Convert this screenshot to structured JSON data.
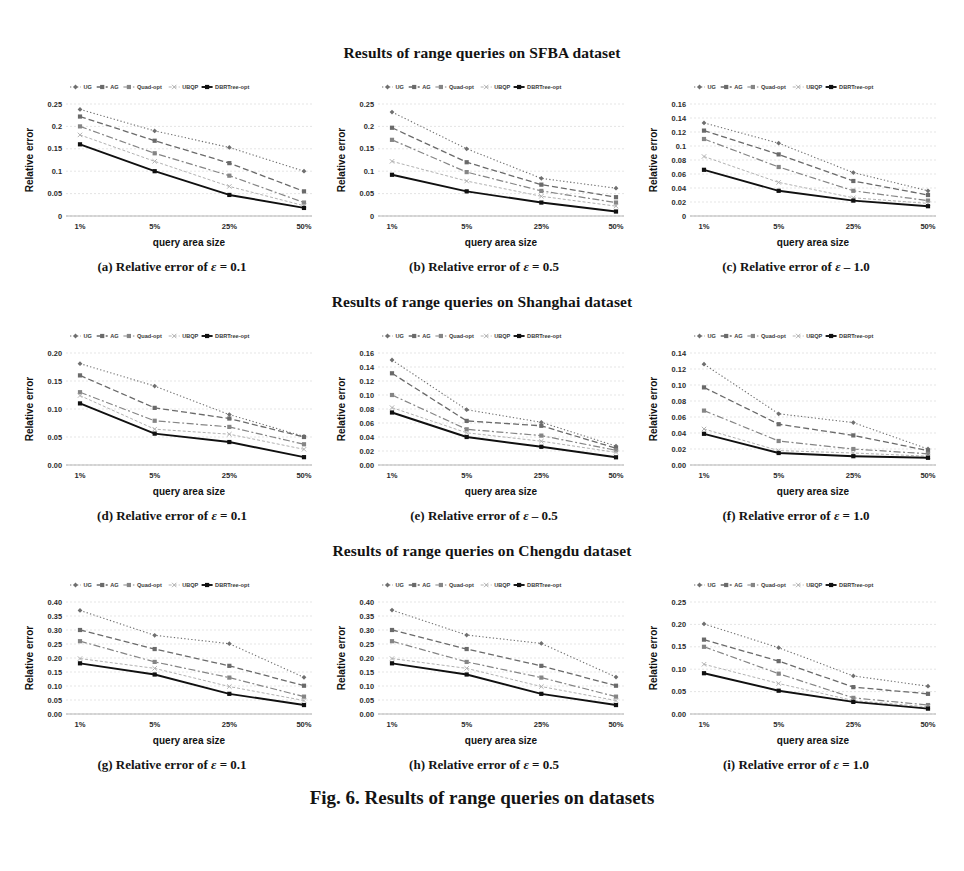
{
  "figure": {
    "caption": "Fig. 6. Results of range queries on datasets",
    "sections": [
      {
        "title": "Results of range queries on SFBA dataset"
      },
      {
        "title": "Results of range queries on Shanghai dataset"
      },
      {
        "title": "Results of range queries on Chengdu dataset"
      }
    ]
  },
  "series_names": [
    "UG",
    "AG",
    "Quad-opt",
    "UBQP",
    "DBRTree-opt"
  ],
  "series_colors": [
    "#7b7b7b",
    "#6e6e6e",
    "#8a8a8a",
    "#b0b0b0",
    "#111111"
  ],
  "axis": {
    "xlabel": "query area size",
    "ylabel": "Relative error",
    "categories": [
      "1%",
      "5%",
      "25%",
      "50%"
    ]
  },
  "chart_data": [
    {
      "id": "a",
      "type": "line",
      "title": "(a) Relative error of ε = 0.1",
      "caption_prefix": "(a) Relative error of",
      "caption_eps": "ε",
      "caption_value": "= 0.1",
      "dataset": "SFBA",
      "epsilon": 0.1,
      "xlabel": "query area size",
      "ylabel": "Relative error",
      "categories": [
        "1%",
        "5%",
        "25%",
        "50%"
      ],
      "ylim": [
        0,
        0.25
      ],
      "yticks": [
        0,
        0.05,
        0.1,
        0.15,
        0.2,
        0.25
      ],
      "ytick_labels": [
        "0",
        "0.05",
        "0.1",
        "0.15",
        "0.2",
        "0.25"
      ],
      "grid": true,
      "legend_position": "top",
      "series": [
        {
          "name": "UG",
          "values": [
            0.238,
            0.19,
            0.153,
            0.1
          ]
        },
        {
          "name": "AG",
          "values": [
            0.222,
            0.168,
            0.118,
            0.055
          ]
        },
        {
          "name": "Quad-opt",
          "values": [
            0.2,
            0.14,
            0.09,
            0.03
          ]
        },
        {
          "name": "UBQP",
          "values": [
            0.181,
            0.122,
            0.066,
            0.023
          ]
        },
        {
          "name": "DBRTree-opt",
          "values": [
            0.16,
            0.1,
            0.047,
            0.018
          ]
        }
      ]
    },
    {
      "id": "b",
      "type": "line",
      "title": "(b) Relative error of ε = 0.5",
      "caption_prefix": "(b) Relative error of",
      "caption_eps": "ε",
      "caption_value": "= 0.5",
      "dataset": "SFBA",
      "epsilon": 0.5,
      "xlabel": "query area size",
      "ylabel": "Relative error",
      "categories": [
        "1%",
        "5%",
        "25%",
        "50%"
      ],
      "ylim": [
        0,
        0.25
      ],
      "yticks": [
        0,
        0.05,
        0.1,
        0.15,
        0.2,
        0.25
      ],
      "ytick_labels": [
        "0",
        "0.05",
        "0.1",
        "0.15",
        "0.2",
        "0.25"
      ],
      "grid": true,
      "legend_position": "top",
      "series": [
        {
          "name": "UG",
          "values": [
            0.232,
            0.15,
            0.084,
            0.062
          ]
        },
        {
          "name": "AG",
          "values": [
            0.197,
            0.12,
            0.07,
            0.042
          ]
        },
        {
          "name": "Quad-opt",
          "values": [
            0.17,
            0.098,
            0.056,
            0.03
          ]
        },
        {
          "name": "UBQP",
          "values": [
            0.122,
            0.078,
            0.044,
            0.022
          ]
        },
        {
          "name": "DBRTree-opt",
          "values": [
            0.092,
            0.055,
            0.03,
            0.01
          ]
        }
      ]
    },
    {
      "id": "c",
      "type": "line",
      "title": "(c) Relative error of ε = 1.0",
      "caption_prefix": "(c) Relative error of",
      "caption_eps": "ε",
      "caption_value": "– 1.0",
      "dataset": "SFBA",
      "epsilon": 1.0,
      "xlabel": "query area size",
      "ylabel": "Relative error",
      "categories": [
        "1%",
        "5%",
        "25%",
        "50%"
      ],
      "ylim": [
        0,
        0.16
      ],
      "yticks": [
        0,
        0.02,
        0.04,
        0.06,
        0.08,
        0.1,
        0.12,
        0.14,
        0.16
      ],
      "ytick_labels": [
        "0",
        "0.02",
        "0.04",
        "0.06",
        "0.08",
        "0.1",
        "0.12",
        "0.14",
        "0.16"
      ],
      "grid": true,
      "legend_position": "top",
      "series": [
        {
          "name": "UG",
          "values": [
            0.133,
            0.104,
            0.062,
            0.036
          ]
        },
        {
          "name": "AG",
          "values": [
            0.122,
            0.088,
            0.05,
            0.03
          ]
        },
        {
          "name": "Quad-opt",
          "values": [
            0.11,
            0.07,
            0.036,
            0.022
          ]
        },
        {
          "name": "UBQP",
          "values": [
            0.085,
            0.048,
            0.026,
            0.018
          ]
        },
        {
          "name": "DBRTree-opt",
          "values": [
            0.066,
            0.036,
            0.022,
            0.014
          ]
        }
      ]
    },
    {
      "id": "d",
      "type": "line",
      "title": "(d) Relative error of ε = 0.1",
      "caption_prefix": "(d) Relative error of",
      "caption_eps": "ε",
      "caption_value": "= 0.1",
      "dataset": "Shanghai",
      "epsilon": 0.1,
      "xlabel": "query area size",
      "ylabel": "Relative error",
      "categories": [
        "1%",
        "5%",
        "25%",
        "50%"
      ],
      "ylim": [
        0,
        0.2
      ],
      "yticks": [
        0,
        0.05,
        0.1,
        0.15,
        0.2
      ],
      "ytick_labels": [
        "0.00",
        "0.05",
        "0.10",
        "0.15",
        "0.20"
      ],
      "grid": true,
      "legend_position": "top",
      "series": [
        {
          "name": "UG",
          "values": [
            0.181,
            0.141,
            0.09,
            0.051
          ]
        },
        {
          "name": "AG",
          "values": [
            0.16,
            0.102,
            0.083,
            0.05
          ]
        },
        {
          "name": "Quad-opt",
          "values": [
            0.13,
            0.079,
            0.068,
            0.037
          ]
        },
        {
          "name": "UBQP",
          "values": [
            0.124,
            0.064,
            0.055,
            0.028
          ]
        },
        {
          "name": "DBRTree-opt",
          "values": [
            0.11,
            0.056,
            0.041,
            0.014
          ]
        }
      ]
    },
    {
      "id": "e",
      "type": "line",
      "title": "(e) Relative error of ε – 0.5",
      "caption_prefix": "(e) Relative error of",
      "caption_eps": "ε",
      "caption_value": "– 0.5",
      "dataset": "Shanghai",
      "epsilon": 0.5,
      "xlabel": "query area size",
      "ylabel": "Relative error",
      "categories": [
        "1%",
        "5%",
        "25%",
        "50%"
      ],
      "ylim": [
        0,
        0.16
      ],
      "yticks": [
        0,
        0.02,
        0.04,
        0.06,
        0.08,
        0.1,
        0.12,
        0.14,
        0.16
      ],
      "ytick_labels": [
        "0.00",
        "0.02",
        "0.04",
        "0.06",
        "0.08",
        "0.10",
        "0.12",
        "0.14",
        "0.16"
      ],
      "grid": true,
      "legend_position": "top",
      "series": [
        {
          "name": "UG",
          "values": [
            0.15,
            0.079,
            0.061,
            0.027
          ]
        },
        {
          "name": "AG",
          "values": [
            0.131,
            0.063,
            0.056,
            0.024
          ]
        },
        {
          "name": "Quad-opt",
          "values": [
            0.1,
            0.051,
            0.042,
            0.021
          ]
        },
        {
          "name": "UBQP",
          "values": [
            0.082,
            0.046,
            0.034,
            0.018
          ]
        },
        {
          "name": "DBRTree-opt",
          "values": [
            0.075,
            0.04,
            0.026,
            0.011
          ]
        }
      ]
    },
    {
      "id": "f",
      "type": "line",
      "title": "(f) Relative error of ε = 1.0",
      "caption_prefix": "(f) Relative error of",
      "caption_eps": "ε",
      "caption_value": "= 1.0",
      "dataset": "Shanghai",
      "epsilon": 1.0,
      "xlabel": "query area size",
      "ylabel": "Relative error",
      "categories": [
        "1%",
        "5%",
        "25%",
        "50%"
      ],
      "ylim": [
        0,
        0.14
      ],
      "yticks": [
        0,
        0.02,
        0.04,
        0.06,
        0.08,
        0.1,
        0.12,
        0.14
      ],
      "ytick_labels": [
        "0.00",
        "0.02",
        "0.04",
        "0.06",
        "0.08",
        "0.10",
        "0.12",
        "0.14"
      ],
      "grid": true,
      "legend_position": "top",
      "series": [
        {
          "name": "UG",
          "values": [
            0.126,
            0.064,
            0.053,
            0.02
          ]
        },
        {
          "name": "AG",
          "values": [
            0.097,
            0.051,
            0.037,
            0.018
          ]
        },
        {
          "name": "Quad-opt",
          "values": [
            0.068,
            0.03,
            0.02,
            0.014
          ]
        },
        {
          "name": "UBQP",
          "values": [
            0.045,
            0.018,
            0.015,
            0.011
          ]
        },
        {
          "name": "DBRTree-opt",
          "values": [
            0.039,
            0.015,
            0.011,
            0.009
          ]
        }
      ]
    },
    {
      "id": "g",
      "type": "line",
      "title": "(g) Relative error of ε = 0.1",
      "caption_prefix": "(g) Relative error of",
      "caption_eps": "ε",
      "caption_value": "= 0.1",
      "dataset": "Chengdu",
      "epsilon": 0.1,
      "xlabel": "query area size",
      "ylabel": "Relative error",
      "categories": [
        "1%",
        "5%",
        "25%",
        "50%"
      ],
      "ylim": [
        0,
        0.4
      ],
      "yticks": [
        0,
        0.05,
        0.1,
        0.15,
        0.2,
        0.25,
        0.3,
        0.35,
        0.4
      ],
      "ytick_labels": [
        "0.00",
        "0.05",
        "0.10",
        "0.15",
        "0.20",
        "0.25",
        "0.30",
        "0.35",
        "0.40"
      ],
      "grid": true,
      "legend_position": "top",
      "series": [
        {
          "name": "UG",
          "values": [
            0.37,
            0.281,
            0.251,
            0.131
          ]
        },
        {
          "name": "AG",
          "values": [
            0.3,
            0.232,
            0.172,
            0.101
          ]
        },
        {
          "name": "Quad-opt",
          "values": [
            0.26,
            0.186,
            0.13,
            0.062
          ]
        },
        {
          "name": "UBQP",
          "values": [
            0.198,
            0.163,
            0.098,
            0.048
          ]
        },
        {
          "name": "DBRTree-opt",
          "values": [
            0.181,
            0.141,
            0.072,
            0.032
          ]
        }
      ]
    },
    {
      "id": "h",
      "type": "line",
      "title": "(h) Relative error of ε = 0.5",
      "caption_prefix": "(h) Relative error of",
      "caption_eps": "ε",
      "caption_value": "= 0.5",
      "dataset": "Chengdu",
      "epsilon": 0.5,
      "xlabel": "query area size",
      "ylabel": "Relative error",
      "categories": [
        "1%",
        "5%",
        "25%",
        "50%"
      ],
      "ylim": [
        0,
        0.4
      ],
      "yticks": [
        0,
        0.05,
        0.1,
        0.15,
        0.2,
        0.25,
        0.3,
        0.35,
        0.4
      ],
      "ytick_labels": [
        "0.00",
        "0.05",
        "0.10",
        "0.15",
        "0.20",
        "0.25",
        "0.30",
        "0.35",
        "0.40"
      ],
      "grid": true,
      "legend_position": "top",
      "series": [
        {
          "name": "UG",
          "values": [
            0.371,
            0.282,
            0.252,
            0.132
          ]
        },
        {
          "name": "AG",
          "values": [
            0.3,
            0.232,
            0.172,
            0.101
          ]
        },
        {
          "name": "Quad-opt",
          "values": [
            0.26,
            0.186,
            0.13,
            0.062
          ]
        },
        {
          "name": "UBQP",
          "values": [
            0.198,
            0.163,
            0.098,
            0.048
          ]
        },
        {
          "name": "DBRTree-opt",
          "values": [
            0.181,
            0.141,
            0.072,
            0.032
          ]
        }
      ]
    },
    {
      "id": "i",
      "type": "line",
      "title": "(i) Relative error of ε = 1.0",
      "caption_prefix": "(i) Relative error of",
      "caption_eps": "ε",
      "caption_value": "= 1.0",
      "dataset": "Chengdu",
      "epsilon": 1.0,
      "xlabel": "query area size",
      "ylabel": "Relative error",
      "categories": [
        "1%",
        "5%",
        "25%",
        "50%"
      ],
      "ylim": [
        0,
        0.25
      ],
      "yticks": [
        0,
        0.05,
        0.1,
        0.15,
        0.2,
        0.25
      ],
      "ytick_labels": [
        "0.00",
        "0.05",
        "0.10",
        "0.15",
        "0.20",
        "0.25"
      ],
      "grid": true,
      "legend_position": "top",
      "series": [
        {
          "name": "UG",
          "values": [
            0.201,
            0.148,
            0.085,
            0.062
          ]
        },
        {
          "name": "AG",
          "values": [
            0.166,
            0.118,
            0.06,
            0.045
          ]
        },
        {
          "name": "Quad-opt",
          "values": [
            0.15,
            0.09,
            0.036,
            0.02
          ]
        },
        {
          "name": "UBQP",
          "values": [
            0.111,
            0.068,
            0.03,
            0.016
          ]
        },
        {
          "name": "DBRTree-opt",
          "values": [
            0.091,
            0.052,
            0.027,
            0.012
          ]
        }
      ]
    }
  ]
}
